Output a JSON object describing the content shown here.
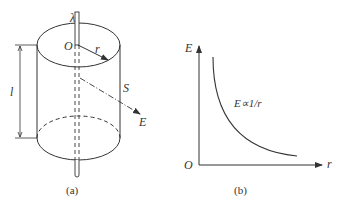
{
  "figure_a": {
    "caption": "(a)",
    "labels": {
      "line_charge": "λ",
      "origin": "O",
      "radius": "r",
      "length": "l",
      "surface": "S",
      "field": "E"
    }
  },
  "figure_b": {
    "caption": "(b)",
    "labels": {
      "y_axis": "E",
      "x_axis": "r",
      "origin": "O",
      "relation": "E∝1/r"
    }
  },
  "colors": {
    "stroke": "#333333",
    "background": "#ffffff"
  }
}
